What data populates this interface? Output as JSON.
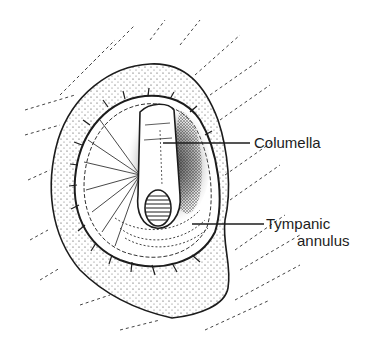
{
  "figure": {
    "labels": {
      "columella": "Columella",
      "tympanic_line1": "Tympanic",
      "tympanic_line2": "annulus"
    },
    "colors": {
      "ink": "#1c1c1c",
      "background": "#ffffff"
    }
  }
}
